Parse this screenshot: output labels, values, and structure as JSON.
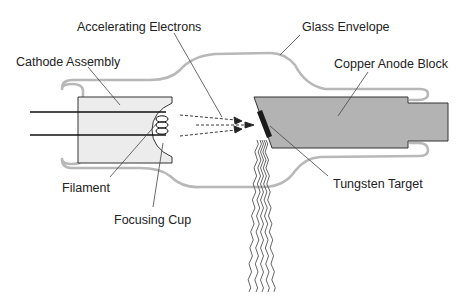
{
  "diagram": {
    "type": "x-ray tube cross-section",
    "labels": {
      "accelerating_electrons": "Accelerating Electrons",
      "glass_envelope": "Glass Envelope",
      "cathode_assembly": "Cathode Assembly",
      "copper_anode_block": "Copper Anode Block",
      "filament": "Filament",
      "focusing_cup": "Focusing Cup",
      "tungsten_target": "Tungsten Target"
    },
    "colors": {
      "glass": "#b8b8b8",
      "cathode_fill": "#ececec",
      "anode_fill": "#b3b3b3",
      "target": "#1a1a1a",
      "outline": "#333333",
      "leader_line": "#444444",
      "xray_wave": "#555555"
    }
  }
}
